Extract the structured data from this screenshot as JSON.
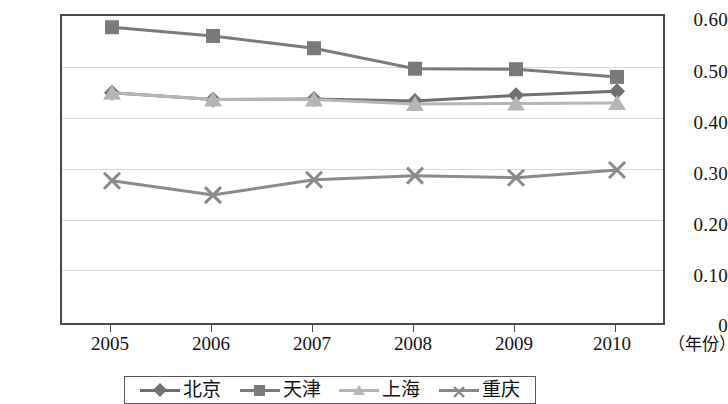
{
  "chart_data": {
    "type": "line",
    "title": "",
    "subtitle": "",
    "xlabel": "（年份）",
    "ylabel": "",
    "x": [
      "2005",
      "2006",
      "2007",
      "2008",
      "2009",
      "2010"
    ],
    "categories": [
      "2005",
      "2006",
      "2007",
      "2008",
      "2009",
      "2010"
    ],
    "ylim": [
      0,
      0.6
    ],
    "yticks": [
      "0.60",
      "0.50",
      "0.40",
      "0.30",
      "0.20",
      "0.10",
      "0"
    ],
    "ytick_values": [
      0.6,
      0.5,
      0.4,
      0.3,
      0.2,
      0.1,
      0
    ],
    "grid": true,
    "grid_axis": "y",
    "legend_position": "bottom",
    "series": [
      {
        "name": "北京",
        "marker": "diamond",
        "color": "#6f6f6f",
        "values": [
          0.45,
          0.437,
          0.438,
          0.434,
          0.445,
          0.453
        ]
      },
      {
        "name": "天津",
        "marker": "square",
        "color": "#7a7a7a",
        "values": [
          0.578,
          0.561,
          0.537,
          0.497,
          0.496,
          0.481
        ]
      },
      {
        "name": "上海",
        "marker": "triangle",
        "color": "#b5b5b5",
        "values": [
          0.45,
          0.437,
          0.437,
          0.428,
          0.429,
          0.43
        ]
      },
      {
        "name": "重庆",
        "marker": "cross",
        "color": "#8a8a8a",
        "values": [
          0.278,
          0.25,
          0.28,
          0.288,
          0.284,
          0.299
        ]
      }
    ]
  },
  "axis": {
    "unit_label": "（年份）"
  },
  "colors": {
    "frame": "#4a4a4a",
    "gridline": "#d8d8d8",
    "background": "#ffffff",
    "text": "#131313"
  }
}
